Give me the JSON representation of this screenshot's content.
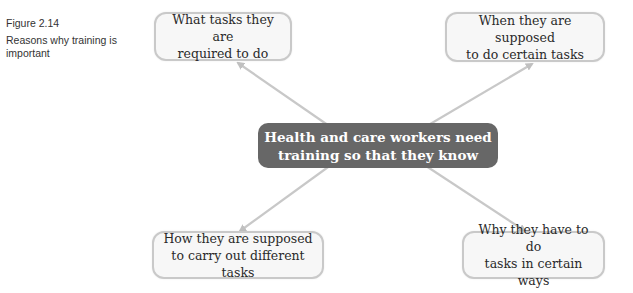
{
  "caption": {
    "figure_label": "Figure 2.14",
    "description": "Reasons why training is important"
  },
  "diagram": {
    "center": {
      "line1": "Health and care workers need",
      "line2": "training so that they know"
    },
    "nodes": [
      {
        "position": "top-left",
        "line1": "What tasks they are",
        "line2": "required to do"
      },
      {
        "position": "top-right",
        "line1": "When they are supposed",
        "line2": "to do certain tasks"
      },
      {
        "position": "bottom-left",
        "line1": "How they are supposed",
        "line2": "to carry out different tasks"
      },
      {
        "position": "bottom-right",
        "line1": "Why they have to do",
        "line2": "tasks in certain ways"
      }
    ],
    "colors": {
      "center_fill": "#676767",
      "node_border": "#c9c9c9",
      "node_fill": "#f7f7f7",
      "arrow": "#c8c8c8"
    }
  }
}
